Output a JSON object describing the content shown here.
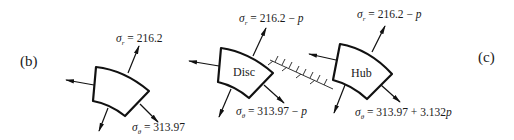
{
  "figure": {
    "panel_left_label": "(b)",
    "panel_right_label": "(c)",
    "elements": [
      {
        "id": "element-b",
        "name": "",
        "sigma_r_symbol": "σ",
        "sigma_r_sub": "r",
        "sigma_r_value": " = 216.2",
        "sigma_theta_symbol": "σ",
        "sigma_theta_sub": "θ",
        "sigma_theta_value": " = 313.97"
      },
      {
        "id": "disc",
        "name": "Disc",
        "sigma_r_symbol": "σ",
        "sigma_r_sub": "r",
        "sigma_r_value": " = 216.2 − ",
        "sigma_r_var": "p",
        "sigma_theta_symbol": "σ",
        "sigma_theta_sub": "θ",
        "sigma_theta_value": " = 313.97 − ",
        "sigma_theta_var": "p"
      },
      {
        "id": "hub",
        "name": "Hub",
        "sigma_r_symbol": "σ",
        "sigma_r_sub": "r",
        "sigma_r_value": " = 216.2 − ",
        "sigma_r_var": "p",
        "sigma_theta_symbol": "σ",
        "sigma_theta_sub": "θ",
        "sigma_theta_value": " = 313.97 + 3.132",
        "sigma_theta_var": "p"
      }
    ],
    "interface": "hatched-contact-line"
  }
}
